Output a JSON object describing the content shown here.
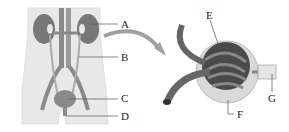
{
  "diagram": {
    "left_panel": {
      "subject": "human urinary system",
      "labels": [
        {
          "id": "A",
          "text": "A",
          "x": 121,
          "y": 19
        },
        {
          "id": "B",
          "text": "B",
          "x": 121,
          "y": 52
        },
        {
          "id": "C",
          "text": "C",
          "x": 121,
          "y": 93
        },
        {
          "id": "D",
          "text": "D",
          "x": 121,
          "y": 111
        }
      ]
    },
    "right_panel": {
      "subject": "nephron glomerulus and capsule (enlarged)",
      "labels": [
        {
          "id": "E",
          "text": "E",
          "x": 206,
          "y": 12
        },
        {
          "id": "F",
          "text": "F",
          "x": 237,
          "y": 111
        },
        {
          "id": "G",
          "text": "G",
          "x": 268,
          "y": 94
        }
      ]
    },
    "colors": {
      "body": "#e6e6e6",
      "organ": "#7a7a7a",
      "vessel": "#6a6a6a",
      "dark": "#3a3a3a",
      "arrow": "#9a9a9a",
      "leader": "#555555"
    }
  }
}
